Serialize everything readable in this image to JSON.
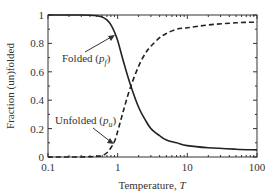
{
  "chart_data": {
    "type": "line",
    "title": "",
    "xlabel": "Temperature, T",
    "ylabel": "Fraction (un)folded",
    "xscale": "log",
    "xlim": [
      0.1,
      100
    ],
    "ylim": [
      0,
      1
    ],
    "xticks": [
      0.1,
      1,
      10,
      100
    ],
    "xtick_labels": [
      "0.1",
      "1",
      "10",
      "100"
    ],
    "yticks": [
      0,
      0.2,
      0.4,
      0.6,
      0.8,
      1
    ],
    "ytick_labels": [
      "0",
      "0.2",
      "0.4",
      "0.6",
      "0.8",
      "1"
    ],
    "grid": false,
    "legend": null,
    "series": [
      {
        "name": "Folded (p_f)",
        "style": "solid",
        "color": "#222222",
        "x": [
          0.1,
          0.3,
          0.5,
          0.6,
          0.7,
          0.8,
          0.9,
          1.0,
          1.2,
          1.5,
          2,
          2.5,
          3,
          4,
          5,
          7,
          10,
          20,
          50,
          100
        ],
        "y": [
          1.0,
          1.0,
          0.995,
          0.985,
          0.965,
          0.93,
          0.88,
          0.82,
          0.68,
          0.52,
          0.35,
          0.26,
          0.2,
          0.15,
          0.12,
          0.1,
          0.08,
          0.065,
          0.055,
          0.05
        ]
      },
      {
        "name": "Unfolded (p_u)",
        "style": "dashed",
        "color": "#222222",
        "x": [
          0.1,
          0.3,
          0.5,
          0.6,
          0.7,
          0.8,
          0.9,
          1.0,
          1.2,
          1.5,
          2,
          2.5,
          3,
          4,
          5,
          7,
          10,
          20,
          50,
          100
        ],
        "y": [
          0.0,
          0.0,
          0.005,
          0.01,
          0.03,
          0.065,
          0.11,
          0.18,
          0.32,
          0.48,
          0.64,
          0.73,
          0.78,
          0.84,
          0.87,
          0.9,
          0.91,
          0.93,
          0.945,
          0.95
        ]
      }
    ],
    "annotations": [
      {
        "text": "Folded",
        "subscript_var": "p",
        "subscript": "f",
        "arrow_to": [
          0.95,
          0.85
        ]
      },
      {
        "text": "Unfolded",
        "subscript_var": "p",
        "subscript": "u",
        "arrow_to": [
          0.87,
          0.1
        ]
      }
    ]
  }
}
